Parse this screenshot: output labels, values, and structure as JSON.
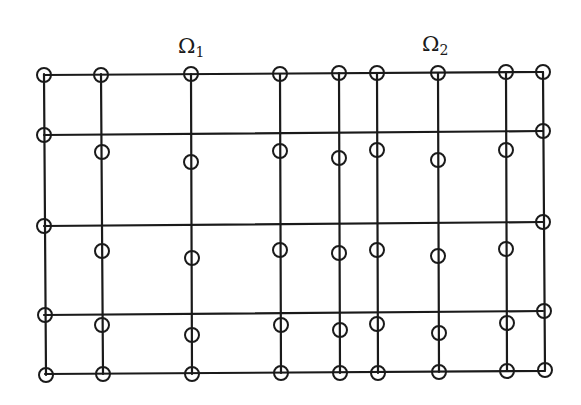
{
  "labels": {
    "omega1": {
      "symbol": "Ω",
      "sub": "1",
      "x": 178,
      "y": 36
    },
    "omega2": {
      "symbol": "Ω",
      "sub": "2",
      "x": 422,
      "y": 34
    }
  },
  "style": {
    "line_color": "#1a1a1a",
    "line_width": 2.2,
    "circle_radius": 7,
    "circle_stroke_width": 2
  },
  "grid": {
    "vertical_lines": [
      {
        "x1": 44,
        "y1": 74,
        "x2": 46,
        "y2": 375
      },
      {
        "x1": 101,
        "y1": 74,
        "x2": 103,
        "y2": 374
      },
      {
        "x1": 191,
        "y1": 74,
        "x2": 192,
        "y2": 374
      },
      {
        "x1": 280,
        "y1": 74,
        "x2": 281,
        "y2": 373
      },
      {
        "x1": 339,
        "y1": 73,
        "x2": 340,
        "y2": 373
      },
      {
        "x1": 377,
        "y1": 73,
        "x2": 378,
        "y2": 373
      },
      {
        "x1": 438,
        "y1": 73,
        "x2": 439,
        "y2": 372
      },
      {
        "x1": 506,
        "y1": 72,
        "x2": 507,
        "y2": 371
      },
      {
        "x1": 543,
        "y1": 72,
        "x2": 545,
        "y2": 370
      }
    ],
    "horizontal_lines": [
      {
        "x1": 44,
        "y1": 75,
        "x2": 543,
        "y2": 72
      },
      {
        "x1": 44,
        "y1": 135,
        "x2": 543,
        "y2": 131
      },
      {
        "x1": 44,
        "y1": 226,
        "x2": 543,
        "y2": 222
      },
      {
        "x1": 44,
        "y1": 315,
        "x2": 543,
        "y2": 311
      },
      {
        "x1": 45,
        "y1": 374,
        "x2": 545,
        "y2": 371
      }
    ]
  },
  "nodes": [
    {
      "x": 44,
      "y": 75
    },
    {
      "x": 101,
      "y": 75
    },
    {
      "x": 191,
      "y": 74
    },
    {
      "x": 280,
      "y": 74
    },
    {
      "x": 339,
      "y": 73
    },
    {
      "x": 377,
      "y": 73
    },
    {
      "x": 438,
      "y": 73
    },
    {
      "x": 506,
      "y": 72
    },
    {
      "x": 543,
      "y": 72
    },
    {
      "x": 44,
      "y": 135
    },
    {
      "x": 543,
      "y": 131
    },
    {
      "x": 102,
      "y": 152
    },
    {
      "x": 191,
      "y": 162
    },
    {
      "x": 280,
      "y": 151
    },
    {
      "x": 339,
      "y": 158
    },
    {
      "x": 377,
      "y": 150
    },
    {
      "x": 438,
      "y": 160
    },
    {
      "x": 506,
      "y": 150
    },
    {
      "x": 44,
      "y": 226
    },
    {
      "x": 543,
      "y": 222
    },
    {
      "x": 102,
      "y": 251
    },
    {
      "x": 192,
      "y": 258
    },
    {
      "x": 280,
      "y": 250
    },
    {
      "x": 339,
      "y": 253
    },
    {
      "x": 377,
      "y": 250
    },
    {
      "x": 438,
      "y": 256
    },
    {
      "x": 506,
      "y": 249
    },
    {
      "x": 45,
      "y": 315
    },
    {
      "x": 544,
      "y": 311
    },
    {
      "x": 102,
      "y": 325
    },
    {
      "x": 192,
      "y": 335
    },
    {
      "x": 281,
      "y": 325
    },
    {
      "x": 340,
      "y": 330
    },
    {
      "x": 377,
      "y": 324
    },
    {
      "x": 439,
      "y": 333
    },
    {
      "x": 507,
      "y": 323
    },
    {
      "x": 46,
      "y": 375
    },
    {
      "x": 103,
      "y": 374
    },
    {
      "x": 192,
      "y": 374
    },
    {
      "x": 281,
      "y": 373
    },
    {
      "x": 340,
      "y": 373
    },
    {
      "x": 378,
      "y": 373
    },
    {
      "x": 439,
      "y": 372
    },
    {
      "x": 507,
      "y": 371
    },
    {
      "x": 545,
      "y": 370
    }
  ]
}
